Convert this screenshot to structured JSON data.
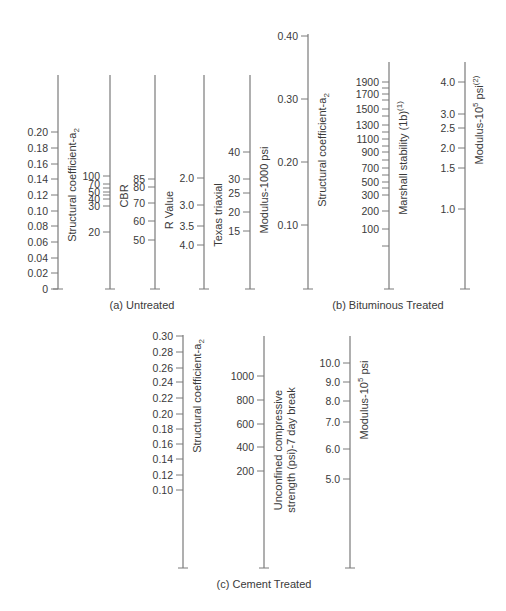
{
  "colors": {
    "line": "#7a7a7a",
    "text": "#3a3a3a",
    "background": "#ffffff"
  },
  "chart_data": [
    {
      "type": "nomograph",
      "title": "(a) Untreated",
      "caption_pos": [
        142,
        309
      ],
      "scales": [
        {
          "name": "structural-coefficient-a2",
          "title": "Structural coefficient-a",
          "title_sub": "2",
          "x": 58,
          "top": 75,
          "bottom": 289,
          "label_side": "left",
          "title_x": 72,
          "title_y": 185,
          "ticks": [
            {
              "label": "0.20",
              "y": 132
            },
            {
              "label": "0.18",
              "y": 148
            },
            {
              "label": "0.16",
              "y": 164
            },
            {
              "label": "0.14",
              "y": 179
            },
            {
              "label": "0.12",
              "y": 195
            },
            {
              "label": "0.10",
              "y": 211
            },
            {
              "label": "0.08",
              "y": 226
            },
            {
              "label": "0.06",
              "y": 242
            },
            {
              "label": "0.04",
              "y": 258
            },
            {
              "label": "0.02",
              "y": 273
            },
            {
              "label": "0",
              "y": 289
            }
          ]
        },
        {
          "name": "cbr",
          "title": "CBR",
          "title_sub": "",
          "x": 110,
          "top": 75,
          "bottom": 289,
          "label_side": "left",
          "title_x": 124,
          "title_y": 196,
          "ticks": [
            {
              "label": "100",
              "y": 176
            },
            {
              "label": "70",
              "y": 184
            },
            {
              "label": "50",
              "y": 192
            },
            {
              "label": "",
              "y": 188
            },
            {
              "label": "40",
              "y": 199
            },
            {
              "label": "",
              "y": 195
            },
            {
              "label": "30",
              "y": 206
            },
            {
              "label": "20",
              "y": 232
            }
          ]
        },
        {
          "name": "r-value",
          "title": "R Value",
          "title_sub": "",
          "x": 155,
          "top": 75,
          "bottom": 289,
          "label_side": "left",
          "title_x": 169,
          "title_y": 210,
          "ticks": [
            {
              "label": "85",
              "y": 179
            },
            {
              "label": "80",
              "y": 187
            },
            {
              "label": "70",
              "y": 203
            },
            {
              "label": "60",
              "y": 221
            },
            {
              "label": "50",
              "y": 240
            }
          ]
        },
        {
          "name": "texas-triaxial",
          "title": "Texas triaxial",
          "title_sub": "",
          "x": 204,
          "top": 75,
          "bottom": 289,
          "label_side": "left",
          "title_x": 218,
          "title_y": 215,
          "ticks": [
            {
              "label": "2.0",
              "y": 178
            },
            {
              "label": "3.0",
              "y": 205
            },
            {
              "label": "3.5",
              "y": 226
            },
            {
              "label": "4.0",
              "y": 245
            }
          ]
        },
        {
          "name": "modulus-1000-psi",
          "title": "Modulus-1000 psi",
          "title_sub": "",
          "x": 250,
          "top": 75,
          "bottom": 289,
          "label_side": "left",
          "title_x": 264,
          "title_y": 190,
          "ticks": [
            {
              "label": "40",
              "y": 152
            },
            {
              "label": "30",
              "y": 179
            },
            {
              "label": "25",
              "y": 193
            },
            {
              "label": "20",
              "y": 212
            },
            {
              "label": "15",
              "y": 231
            }
          ]
        }
      ]
    },
    {
      "type": "nomograph",
      "title": "(b) Bituminous Treated",
      "caption_pos": [
        388,
        309
      ],
      "scales": [
        {
          "name": "structural-coefficient-a2",
          "title": "Structural coefficient-a",
          "title_sub": "2",
          "x": 308,
          "top": 34,
          "bottom": 289,
          "label_side": "left",
          "title_x": 322,
          "title_y": 150,
          "ticks": [
            {
              "label": "0.40",
              "y": 36
            },
            {
              "label": "0.30",
              "y": 99
            },
            {
              "label": "0.20",
              "y": 162
            },
            {
              "label": "0.10",
              "y": 225
            }
          ]
        },
        {
          "name": "marshall-stability",
          "title": "Marshall stability (1b)",
          "title_sup": "(1)",
          "x": 389,
          "top": 62,
          "bottom": 289,
          "label_side": "left",
          "title_x": 403,
          "title_y": 158,
          "ticks": [
            {
              "label": "1900",
              "y": 82
            },
            {
              "label": "",
              "y": 88
            },
            {
              "label": "1700",
              "y": 94
            },
            {
              "label": "",
              "y": 100
            },
            {
              "label": "1500",
              "y": 109
            },
            {
              "label": "",
              "y": 116
            },
            {
              "label": "1300",
              "y": 125
            },
            {
              "label": "",
              "y": 132
            },
            {
              "label": "1100",
              "y": 139
            },
            {
              "label": "",
              "y": 146
            },
            {
              "label": "900",
              "y": 152
            },
            {
              "label": "",
              "y": 160
            },
            {
              "label": "700",
              "y": 168
            },
            {
              "label": "",
              "y": 175
            },
            {
              "label": "500",
              "y": 182
            },
            {
              "label": "",
              "y": 188
            },
            {
              "label": "300",
              "y": 195
            },
            {
              "label": "200",
              "y": 211
            },
            {
              "label": "100",
              "y": 229
            },
            {
              "label": "",
              "y": 246
            }
          ]
        },
        {
          "name": "modulus-10-5-psi",
          "title": "Modulus-10",
          "title_exp": "5",
          "title_tail": " psi",
          "title_sup": "(2)",
          "x": 465,
          "top": 62,
          "bottom": 289,
          "label_side": "left",
          "title_x": 479,
          "title_y": 120,
          "ticks": [
            {
              "label": "4.0",
              "y": 82
            },
            {
              "label": "3.0",
              "y": 114
            },
            {
              "label": "2.5",
              "y": 128
            },
            {
              "label": "2.0",
              "y": 148
            },
            {
              "label": "1.5",
              "y": 168
            },
            {
              "label": "1.0",
              "y": 209
            }
          ]
        }
      ]
    },
    {
      "type": "nomograph",
      "title": "(c) Cement Treated",
      "caption_pos": [
        264,
        588
      ],
      "scales": [
        {
          "name": "structural-coefficient-a2",
          "title": "Structural coefficient-a",
          "title_sub": "2",
          "x": 183,
          "top": 335,
          "bottom": 568,
          "label_side": "left",
          "title_x": 197,
          "title_y": 396,
          "ticks": [
            {
              "label": "0.30",
              "y": 336
            },
            {
              "label": "0.28",
              "y": 352
            },
            {
              "label": "0.26",
              "y": 368
            },
            {
              "label": "0.24",
              "y": 382
            },
            {
              "label": "0.22",
              "y": 398
            },
            {
              "label": "0.20",
              "y": 414
            },
            {
              "label": "0.18",
              "y": 429
            },
            {
              "label": "0.16",
              "y": 444
            },
            {
              "label": "0.14",
              "y": 459
            },
            {
              "label": "0.12",
              "y": 475
            },
            {
              "label": "0.10",
              "y": 490
            }
          ]
        },
        {
          "name": "unconfined-compressive-strength",
          "title": "Unconfined compressive",
          "title2": "strength (psi)-7 day break",
          "title_sub": "",
          "x": 264,
          "top": 336,
          "bottom": 568,
          "label_side": "left",
          "title_x": 278,
          "title_y": 450,
          "ticks": [
            {
              "label": "1000",
              "y": 376
            },
            {
              "label": "800",
              "y": 400
            },
            {
              "label": "600",
              "y": 424
            },
            {
              "label": "400",
              "y": 447
            },
            {
              "label": "200",
              "y": 471
            }
          ]
        },
        {
          "name": "modulus-10-5-psi",
          "title": "Modulus-10",
          "title_exp": "5",
          "title_tail": " psi",
          "x": 350,
          "top": 336,
          "bottom": 568,
          "label_side": "left",
          "title_x": 364,
          "title_y": 400,
          "ticks": [
            {
              "label": "10.0",
              "y": 363
            },
            {
              "label": "9.0",
              "y": 382
            },
            {
              "label": "8.0",
              "y": 401
            },
            {
              "label": "7.0",
              "y": 422
            },
            {
              "label": "6.0",
              "y": 449
            },
            {
              "label": "5.0",
              "y": 479
            }
          ]
        }
      ]
    }
  ]
}
